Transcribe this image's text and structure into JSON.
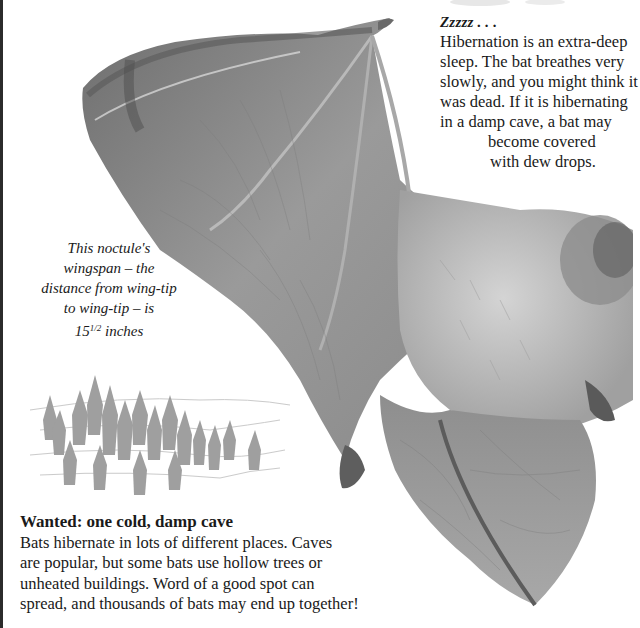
{
  "page": {
    "background": "#ffffff",
    "ink": "#1a1a1a"
  },
  "hibernation_box": {
    "title": "Zzzzz . . .",
    "lines": [
      "Hibernation is an extra-deep",
      "sleep. The bat breathes very",
      "slowly, and you might think it",
      "was dead. If it is hibernating",
      "in a damp cave, a bat may",
      "become covered",
      "with dew drops."
    ]
  },
  "wingspan_caption": {
    "lines": [
      "This noctule's",
      "wingspan – the",
      "distance from wing-tip",
      "to wing-tip – is"
    ],
    "measure_whole": "15",
    "measure_fraction": "1/2",
    "measure_unit": "inches"
  },
  "cave_box": {
    "title": "Wanted: one cold, damp cave",
    "lines": [
      "Bats hibernate in lots of different places. Caves",
      "are popular, but some bats use hollow trees or",
      "unheated buildings. Word of a good spot can",
      "spread, and thousands of bats may end up together!"
    ]
  },
  "images": {
    "main_photo": "noctule-bat-in-flight",
    "illustration": "hibernating-bat-cluster"
  }
}
